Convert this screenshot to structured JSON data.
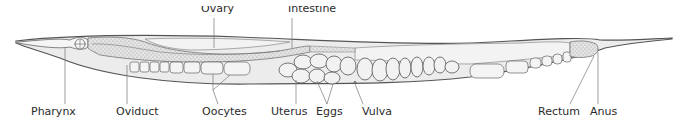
{
  "diagram": {
    "colors": {
      "outline": "#555555",
      "body_fill": "#ececec",
      "organ_fill": "#f5f5f5",
      "stipple": "#9a9a9a",
      "leader_line": "#777777",
      "label_text": "#2b2b2b"
    },
    "labels_top": [
      {
        "id": "ovary",
        "text": "Ovary",
        "x": 201
      },
      {
        "id": "intestine",
        "text": "Intestine",
        "x": 288
      }
    ],
    "labels_bottom": [
      {
        "id": "pharynx",
        "text": "Pharynx",
        "x": 31
      },
      {
        "id": "oviduct",
        "text": "Oviduct",
        "x": 116
      },
      {
        "id": "oocytes",
        "text": "Oocytes",
        "x": 202
      },
      {
        "id": "uterus",
        "text": "Uterus",
        "x": 271
      },
      {
        "id": "eggs",
        "text": "Eggs",
        "x": 316
      },
      {
        "id": "vulva",
        "text": "Vulva",
        "x": 362
      },
      {
        "id": "rectum",
        "text": "Rectum",
        "x": 538
      },
      {
        "id": "anus",
        "text": "Anus",
        "x": 590
      }
    ]
  }
}
